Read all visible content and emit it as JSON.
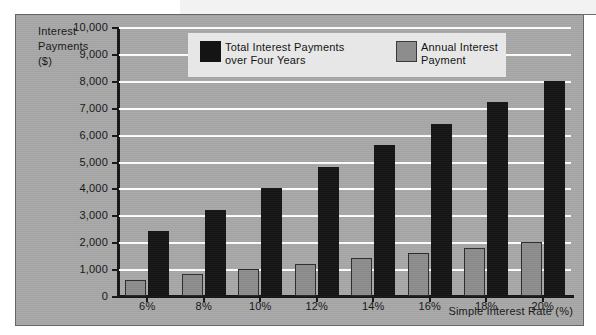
{
  "chart_data": {
    "type": "bar",
    "title": "",
    "xlabel": "Simple Interest Rate (%)",
    "ylabel": "Interest\nPayments\n($)",
    "categories": [
      "6%",
      "8%",
      "10%",
      "12%",
      "14%",
      "16%",
      "18%",
      "20%"
    ],
    "series": [
      {
        "name": "Total Interest Payments\nover Four Years",
        "color": "#141414",
        "values": [
          2400,
          3200,
          4000,
          4800,
          5600,
          6400,
          7200,
          8000
        ]
      },
      {
        "name": "Annual Interest\nPayment",
        "color": "#8d8d8d",
        "values": [
          600,
          800,
          1000,
          1200,
          1400,
          1600,
          1800,
          2000
        ]
      }
    ],
    "ylim": [
      0,
      10000
    ],
    "ytick_labels": [
      "0",
      "1,000",
      "2,000",
      "3,000",
      "4,000",
      "5,000",
      "6,000",
      "7,000",
      "8,000",
      "9,000",
      "10,000"
    ],
    "ytick_values": [
      0,
      1000,
      2000,
      3000,
      4000,
      5000,
      6000,
      7000,
      8000,
      9000,
      10000
    ],
    "grid": true,
    "gridline_color": "#ffffff",
    "legend_position": "top-center",
    "plot_background": "#a8a8a8",
    "axis_color": "#161616"
  },
  "legend": {
    "entries": [
      {
        "label": "Total Interest Payments\nover Four Years",
        "swatch": "total"
      },
      {
        "label": "Annual Interest\nPayment",
        "swatch": "annual"
      }
    ]
  },
  "axes": {
    "y_title": "Interest\nPayments\n($)",
    "x_title": "Simple Interest Rate (%)"
  }
}
